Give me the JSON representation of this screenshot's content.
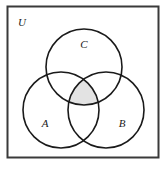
{
  "figure": {
    "type": "venn-diagram",
    "background_color": "#ffffff",
    "canvas": {
      "width": 167,
      "height": 171
    }
  },
  "universe": {
    "label": "U",
    "label_x": 22,
    "label_y": 23,
    "rect": {
      "x": 7.5,
      "y": 6.5,
      "width": 151,
      "height": 151
    },
    "stroke_color": "#3a3a3a",
    "stroke_width": 2,
    "fill_color": "#ffffff"
  },
  "circles": [
    {
      "label": "C",
      "name": "set-c",
      "cx": 84,
      "cy": 67,
      "r": 38,
      "label_x": 84,
      "label_y": 45,
      "stroke_color": "#1a1a1a",
      "stroke_width": 1.6,
      "fill_color": "none"
    },
    {
      "label": "A",
      "name": "set-a",
      "cx": 61,
      "cy": 110,
      "r": 38,
      "label_x": 45,
      "label_y": 124,
      "stroke_color": "#1a1a1a",
      "stroke_width": 1.6,
      "fill_color": "none"
    },
    {
      "label": "B",
      "name": "set-b",
      "cx": 106,
      "cy": 110,
      "r": 38,
      "label_x": 122,
      "label_y": 124,
      "stroke_color": "#1a1a1a",
      "stroke_width": 1.6,
      "fill_color": "none"
    }
  ],
  "shaded_region": {
    "name": "triple-intersection",
    "description": "A intersect B intersect C",
    "fill_color": "#e3e3e3",
    "opacity": 1
  },
  "chart_data": {
    "type": "venn",
    "sets": [
      "A",
      "B",
      "C"
    ],
    "universe_label": "U",
    "shaded_regions": [
      "A∩B∩C"
    ],
    "set_geometry": [
      {
        "set": "C",
        "cx": 84,
        "cy": 67,
        "r": 38
      },
      {
        "set": "A",
        "cx": 61,
        "cy": 110,
        "r": 38
      },
      {
        "set": "B",
        "cx": 106,
        "cy": 110,
        "r": 38
      }
    ]
  }
}
